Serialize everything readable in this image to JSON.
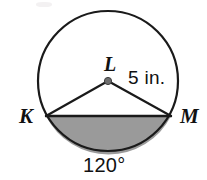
{
  "figure": {
    "kind": "circle-with-shaded-segment",
    "title": "",
    "center_label": "L",
    "left_point_label": "K",
    "right_point_label": "M",
    "radius_label": "5 in.",
    "angle_label": "120°",
    "colors": {
      "stroke": "#1a1a1a",
      "segment_fill": "#9a9a9a",
      "center_dot": "#6f6f6f",
      "background": "#ffffff"
    },
    "geometry": {
      "center_x": 108,
      "center_y": 81,
      "radius_px": 70,
      "radius_value": 5,
      "radius_units": "in.",
      "central_angle_deg": 120,
      "chord_y": 117,
      "point_k_x": 46,
      "point_k_y": 116,
      "point_m_x": 171,
      "point_m_y": 116,
      "stroke_width": 2.2,
      "center_dot_radius": 3.6
    }
  }
}
